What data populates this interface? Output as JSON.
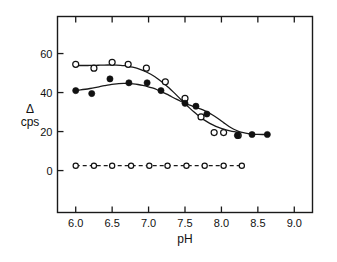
{
  "chart_data": {
    "type": "scatter",
    "title": "",
    "xlabel": "pH",
    "ylabel": "Δ cps",
    "ylabel_lines": [
      "Δ",
      "cps"
    ],
    "xlim": [
      5.75,
      9.25
    ],
    "ylim": [
      -21.5,
      79.0
    ],
    "xticks": [
      6.0,
      6.5,
      7.0,
      7.5,
      8.0,
      8.5,
      9.0
    ],
    "xtick_labels": [
      "6.0",
      "6.5",
      "7.0",
      "7.5",
      "8.0",
      "8.5",
      "9.0"
    ],
    "yticks": [
      0,
      20,
      40,
      60
    ],
    "ytick_labels": [
      "0",
      "20",
      "40",
      "60"
    ],
    "grid": false,
    "legend": "none",
    "frame": "box",
    "series": [
      {
        "name": "open-circles",
        "marker": "open-circle",
        "line": "fitted-sigmoid-solid",
        "points": [
          {
            "x": 6.0,
            "y": 54.5
          },
          {
            "x": 6.25,
            "y": 52.5
          },
          {
            "x": 6.5,
            "y": 55.5
          },
          {
            "x": 6.72,
            "y": 54.5
          },
          {
            "x": 6.97,
            "y": 52.5
          },
          {
            "x": 7.23,
            "y": 45.5
          },
          {
            "x": 7.5,
            "y": 37.0
          },
          {
            "x": 7.72,
            "y": 27.5
          },
          {
            "x": 7.9,
            "y": 19.5
          },
          {
            "x": 8.03,
            "y": 19.5
          },
          {
            "x": 8.23,
            "y": 18.0
          }
        ]
      },
      {
        "name": "filled-circles",
        "marker": "filled-circle",
        "line": "fitted-sigmoid-solid",
        "points": [
          {
            "x": 6.0,
            "y": 41.0
          },
          {
            "x": 6.22,
            "y": 39.5
          },
          {
            "x": 6.47,
            "y": 47.0
          },
          {
            "x": 6.73,
            "y": 45.0
          },
          {
            "x": 6.98,
            "y": 45.0
          },
          {
            "x": 7.17,
            "y": 41.0
          },
          {
            "x": 7.5,
            "y": 34.5
          },
          {
            "x": 7.65,
            "y": 33.0
          },
          {
            "x": 7.8,
            "y": 29.0
          },
          {
            "x": 8.22,
            "y": 18.0
          },
          {
            "x": 8.42,
            "y": 18.5
          },
          {
            "x": 8.63,
            "y": 18.5
          }
        ]
      },
      {
        "name": "baseline-open-circles-dashed",
        "marker": "open-circle-small",
        "line": "dashed",
        "points": [
          {
            "x": 6.0,
            "y": 2.5
          },
          {
            "x": 6.25,
            "y": 2.5
          },
          {
            "x": 6.5,
            "y": 2.5
          },
          {
            "x": 6.76,
            "y": 2.5
          },
          {
            "x": 7.01,
            "y": 2.5
          },
          {
            "x": 7.26,
            "y": 2.5
          },
          {
            "x": 7.52,
            "y": 2.5
          },
          {
            "x": 7.77,
            "y": 2.5
          },
          {
            "x": 8.03,
            "y": 2.5
          },
          {
            "x": 8.28,
            "y": 2.5
          }
        ]
      }
    ]
  }
}
